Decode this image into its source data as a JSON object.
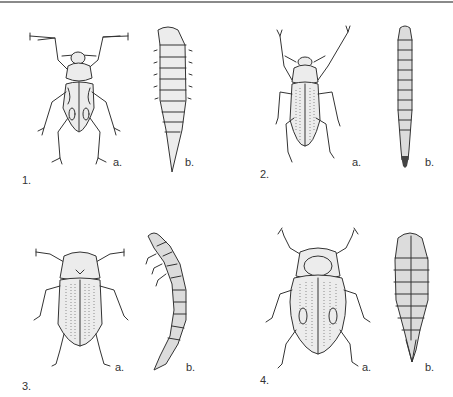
{
  "plate": {
    "top_rule_color": "#8a8a8a",
    "figures": [
      {
        "number": "1.",
        "adult_label": "a.",
        "larva_label": "b.",
        "adult": "long-legged-beetle",
        "larva": "stout-segmented-larva"
      },
      {
        "number": "2.",
        "adult_label": "a.",
        "larva_label": "b.",
        "adult": "elongate-weevil-beetle",
        "larva": "slender-segmented-larva"
      },
      {
        "number": "3.",
        "adult_label": "a.",
        "larva_label": "b.",
        "adult": "striated-beetle",
        "larva": "curved-legged-larva"
      },
      {
        "number": "4.",
        "adult_label": "a.",
        "larva_label": "b.",
        "adult": "round-spotted-beetle",
        "larva": "oval-segmented-larva"
      }
    ]
  }
}
